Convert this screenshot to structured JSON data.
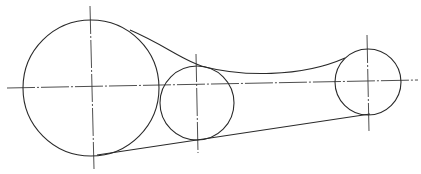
{
  "diagram": {
    "type": "belt-pulley drawing",
    "stroke_color": "#2a2a2a",
    "background": "#ffffff",
    "pulleys": [
      {
        "id": "large",
        "cx": 91,
        "cy": 88,
        "r": 68
      },
      {
        "id": "medium",
        "cx": 197,
        "cy": 103,
        "r": 37
      },
      {
        "id": "small",
        "cx": 368,
        "cy": 82,
        "r": 33
      }
    ],
    "centerlines": {
      "horizontal": {
        "x1": 7,
        "y1": 88,
        "x2": 418,
        "y2": 80
      },
      "vertical": [
        {
          "id": "large",
          "x1": 90,
          "y1": 6,
          "x2": 94,
          "y2": 169
        },
        {
          "id": "medium",
          "x1": 196,
          "y1": 54,
          "x2": 198,
          "y2": 153
        },
        {
          "id": "small",
          "x1": 367,
          "y1": 35,
          "x2": 369,
          "y2": 131
        }
      ]
    },
    "belt": {
      "upper_path": "M 130 30 C 165 45, 185 62, 205 67 C 240 76, 300 78, 345 58",
      "lower_line": {
        "x1": 97,
        "y1": 155,
        "x2": 370,
        "y2": 114
      }
    }
  }
}
